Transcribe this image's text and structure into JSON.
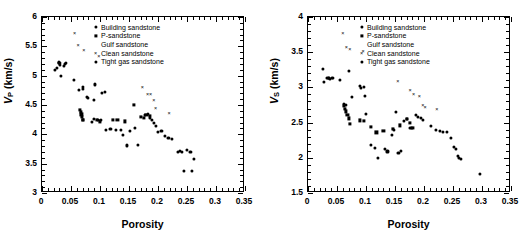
{
  "figure": {
    "panels": [
      "left",
      "right"
    ]
  },
  "legend": {
    "entries": [
      {
        "label": "Building sandstone",
        "marker": "circle-icon"
      },
      {
        "label": "P-sandstone",
        "marker": "square-icon"
      },
      {
        "label": "Gulf sandstone",
        "marker": "triangle-icon"
      },
      {
        "label": "Clean sandstone",
        "marker": "cross-icon"
      },
      {
        "label": "Tight gas sandstone",
        "marker": "diamond-icon"
      }
    ]
  },
  "chart_data": [
    {
      "id": "vp-vs-porosity",
      "type": "scatter",
      "title": "",
      "xlabel": "Porosity",
      "ylabel": "VP (km/s)",
      "ylabel_symbol": "V",
      "ylabel_subscript": "P",
      "ylabel_units": "(km/s)",
      "xlim": [
        0,
        0.35
      ],
      "ylim": [
        3,
        6
      ],
      "xticks": [
        0,
        0.05,
        0.1,
        0.15,
        0.2,
        0.25,
        0.3,
        0.35
      ],
      "xticklabels": [
        "0",
        "0.05",
        "0.1",
        "0.15",
        "0.2",
        "0.25",
        "0.3",
        "0.35"
      ],
      "yticks": [
        3,
        3.5,
        4,
        4.5,
        5,
        5.5,
        6
      ],
      "yticklabels": [
        "3",
        "3.5",
        "4",
        "4.5",
        "5",
        "5.5",
        "6"
      ],
      "xminor_per_major": 5,
      "yminor_per_major": 5,
      "grid": false,
      "legend_position": "top-right",
      "series": [
        {
          "name": "Building sandstone",
          "marker": "circle",
          "points": [
            [
              0.022,
              5.1
            ],
            [
              0.026,
              5.13
            ],
            [
              0.029,
              5.21
            ],
            [
              0.03,
              5.22
            ],
            [
              0.031,
              5.19
            ],
            [
              0.033,
              5.0
            ],
            [
              0.038,
              5.17
            ],
            [
              0.04,
              5.2
            ],
            [
              0.042,
              5.21
            ],
            [
              0.055,
              4.93
            ],
            [
              0.063,
              4.76
            ],
            [
              0.07,
              4.8
            ],
            [
              0.071,
              4.78
            ],
            [
              0.078,
              4.64
            ],
            [
              0.08,
              4.62
            ],
            [
              0.09,
              4.58
            ],
            [
              0.092,
              4.85
            ],
            [
              0.104,
              4.71
            ],
            [
              0.108,
              4.72
            ],
            [
              0.086,
              4.21
            ],
            [
              0.09,
              4.26
            ],
            [
              0.096,
              4.25
            ],
            [
              0.102,
              4.24
            ],
            [
              0.11,
              4.08
            ],
            [
              0.118,
              4.09
            ],
            [
              0.128,
              4.07
            ],
            [
              0.136,
              4.07
            ],
            [
              0.14,
              3.99
            ],
            [
              0.146,
              3.81
            ],
            [
              0.152,
              4.06
            ],
            [
              0.16,
              4.11
            ],
            [
              0.166,
              3.82
            ],
            [
              0.178,
              4.33
            ],
            [
              0.182,
              4.35
            ],
            [
              0.186,
              4.28
            ],
            [
              0.19,
              4.24
            ],
            [
              0.193,
              4.19
            ],
            [
              0.196,
              4.14
            ],
            [
              0.2,
              4.04
            ],
            [
              0.206,
              4.05
            ],
            [
              0.212,
              3.98
            ],
            [
              0.218,
              3.94
            ],
            [
              0.224,
              3.92
            ],
            [
              0.235,
              3.7
            ],
            [
              0.238,
              3.71
            ],
            [
              0.242,
              3.7
            ],
            [
              0.244,
              3.37
            ],
            [
              0.25,
              3.74
            ],
            [
              0.256,
              3.7
            ],
            [
              0.258,
              3.38
            ],
            [
              0.262,
              3.58
            ]
          ]
        },
        {
          "name": "P-sandstone",
          "marker": "square",
          "points": [
            [
              0.066,
              4.41
            ],
            [
              0.067,
              4.38
            ],
            [
              0.068,
              4.34
            ],
            [
              0.069,
              4.3
            ],
            [
              0.07,
              4.24
            ],
            [
              0.071,
              4.25
            ],
            [
              0.095,
              4.24
            ],
            [
              0.1,
              4.22
            ],
            [
              0.122,
              4.25
            ],
            [
              0.13,
              4.24
            ],
            [
              0.143,
              4.22
            ],
            [
              0.158,
              4.5
            ],
            [
              0.17,
              4.3
            ],
            [
              0.175,
              4.28
            ],
            [
              0.18,
              4.33
            ],
            [
              0.186,
              4.31
            ]
          ]
        },
        {
          "name": "Gulf sandstone",
          "marker": "triangle",
          "points": [
            [
              0.062,
              4.59
            ],
            [
              0.081,
              4.63
            ],
            [
              0.095,
              4.42
            ],
            [
              0.1,
              4.19
            ],
            [
              0.103,
              4.17
            ],
            [
              0.117,
              3.68
            ],
            [
              0.12,
              3.66
            ],
            [
              0.131,
              3.68
            ],
            [
              0.134,
              3.67
            ],
            [
              0.14,
              4.0
            ],
            [
              0.143,
              3.98
            ],
            [
              0.148,
              3.76
            ],
            [
              0.158,
              3.74
            ],
            [
              0.166,
              4.55
            ],
            [
              0.169,
              4.58
            ],
            [
              0.172,
              4.6
            ],
            [
              0.175,
              4.56
            ],
            [
              0.207,
              3.88
            ],
            [
              0.222,
              4.34
            ],
            [
              0.248,
              3.68
            ],
            [
              0.254,
              3.56
            ],
            [
              0.258,
              3.57
            ],
            [
              0.262,
              3.55
            ],
            [
              0.266,
              3.63
            ],
            [
              0.27,
              3.6
            ],
            [
              0.276,
              3.58
            ],
            [
              0.293,
              3.18
            ],
            [
              0.298,
              3.21
            ]
          ]
        },
        {
          "name": "Clean sandstone",
          "marker": "cross",
          "points": [
            [
              0.056,
              5.72
            ],
            [
              0.062,
              5.53
            ],
            [
              0.072,
              5.43
            ],
            [
              0.098,
              5.34
            ],
            [
              0.173,
              4.8
            ],
            [
              0.182,
              4.69
            ],
            [
              0.187,
              4.69
            ],
            [
              0.193,
              4.58
            ],
            [
              0.196,
              4.45
            ],
            [
              0.219,
              4.37
            ]
          ]
        },
        {
          "name": "Tight gas sandstone",
          "marker": "diamond",
          "points": [
            [
              0.03,
              5.23
            ],
            [
              0.031,
              5.22
            ]
          ]
        }
      ]
    },
    {
      "id": "vs-vs-porosity",
      "type": "scatter",
      "title": "",
      "xlabel": "Porosity",
      "ylabel": "VS (km/s)",
      "ylabel_symbol": "V",
      "ylabel_subscript": "S",
      "ylabel_units": "(km/s)",
      "xlim": [
        0,
        0.35
      ],
      "ylim": [
        1.5,
        4
      ],
      "xticks": [
        0,
        0.05,
        0.1,
        0.15,
        0.2,
        0.25,
        0.3,
        0.35
      ],
      "xticklabels": [
        "0",
        "0.05",
        "0.1",
        "0.15",
        "0.2",
        "0.25",
        "0.3",
        "0.35"
      ],
      "yticks": [
        1.5,
        2,
        2.5,
        3,
        3.5,
        4
      ],
      "yticklabels": [
        "1.5",
        "2",
        "2.5",
        "3",
        "3.5",
        "4"
      ],
      "xminor_per_major": 5,
      "yminor_per_major": 5,
      "grid": false,
      "legend_position": "top-right",
      "series": [
        {
          "name": "Building sandstone",
          "marker": "circle",
          "points": [
            [
              0.026,
              3.26
            ],
            [
              0.028,
              3.08
            ],
            [
              0.033,
              3.13
            ],
            [
              0.036,
              3.14
            ],
            [
              0.038,
              3.12
            ],
            [
              0.041,
              3.14
            ],
            [
              0.043,
              3.14
            ],
            [
              0.055,
              3.11
            ],
            [
              0.062,
              2.77
            ],
            [
              0.066,
              2.75
            ],
            [
              0.07,
              3.23
            ],
            [
              0.076,
              2.87
            ],
            [
              0.09,
              3.02
            ],
            [
              0.092,
              2.99
            ],
            [
              0.096,
              3.0
            ],
            [
              0.098,
              2.88
            ],
            [
              0.1,
              2.62
            ],
            [
              0.108,
              2.18
            ],
            [
              0.115,
              2.14
            ],
            [
              0.12,
              2.0
            ],
            [
              0.133,
              2.12
            ],
            [
              0.137,
              2.09
            ],
            [
              0.145,
              2.33
            ],
            [
              0.148,
              2.39
            ],
            [
              0.152,
              2.65
            ],
            [
              0.156,
              2.07
            ],
            [
              0.16,
              2.1
            ],
            [
              0.166,
              2.52
            ],
            [
              0.17,
              2.55
            ],
            [
              0.176,
              2.42
            ],
            [
              0.18,
              2.43
            ],
            [
              0.186,
              2.61
            ],
            [
              0.19,
              2.58
            ],
            [
              0.194,
              2.57
            ],
            [
              0.198,
              2.54
            ],
            [
              0.212,
              2.45
            ],
            [
              0.22,
              2.39
            ],
            [
              0.228,
              2.38
            ],
            [
              0.232,
              2.37
            ],
            [
              0.24,
              2.37
            ],
            [
              0.246,
              2.28
            ],
            [
              0.252,
              2.15
            ],
            [
              0.255,
              2.13
            ],
            [
              0.258,
              2.02
            ],
            [
              0.26,
              2.0
            ],
            [
              0.263,
              1.99
            ],
            [
              0.296,
              1.77
            ]
          ]
        },
        {
          "name": "P-sandstone",
          "marker": "square",
          "points": [
            [
              0.062,
              2.74
            ],
            [
              0.064,
              2.7
            ],
            [
              0.066,
              2.66
            ],
            [
              0.068,
              2.61
            ],
            [
              0.07,
              2.56
            ],
            [
              0.072,
              2.48
            ],
            [
              0.09,
              2.53
            ],
            [
              0.096,
              2.52
            ],
            [
              0.108,
              2.44
            ],
            [
              0.118,
              2.36
            ],
            [
              0.13,
              2.38
            ],
            [
              0.146,
              2.41
            ],
            [
              0.158,
              2.46
            ],
            [
              0.17,
              2.55
            ],
            [
              0.175,
              2.5
            ],
            [
              0.18,
              2.42
            ]
          ]
        },
        {
          "name": "Gulf sandstone",
          "marker": "triangle",
          "points": [
            [
              0.098,
              2.6
            ],
            [
              0.104,
              2.44
            ],
            [
              0.113,
              1.97
            ],
            [
              0.118,
              1.95
            ],
            [
              0.13,
              1.98
            ],
            [
              0.133,
              2.0
            ],
            [
              0.142,
              2.2
            ],
            [
              0.146,
              2.18
            ],
            [
              0.15,
              2.05
            ],
            [
              0.155,
              2.03
            ],
            [
              0.163,
              2.43
            ],
            [
              0.168,
              2.8
            ],
            [
              0.172,
              2.72
            ],
            [
              0.203,
              2.22
            ],
            [
              0.233,
              2.13
            ],
            [
              0.238,
              1.87
            ],
            [
              0.252,
              1.95
            ],
            [
              0.258,
              2.0
            ],
            [
              0.262,
              1.99
            ],
            [
              0.266,
              2.1
            ],
            [
              0.27,
              2.07
            ],
            [
              0.275,
              2.09
            ],
            [
              0.278,
              2.05
            ],
            [
              0.297,
              1.76
            ]
          ]
        },
        {
          "name": "Clean sandstone",
          "marker": "cross",
          "points": [
            [
              0.06,
              3.77
            ],
            [
              0.066,
              3.58
            ],
            [
              0.072,
              3.54
            ],
            [
              0.095,
              3.51
            ],
            [
              0.155,
              3.09
            ],
            [
              0.176,
              2.96
            ],
            [
              0.182,
              2.9
            ],
            [
              0.192,
              2.88
            ],
            [
              0.198,
              2.75
            ],
            [
              0.202,
              2.72
            ],
            [
              0.222,
              2.69
            ]
          ]
        },
        {
          "name": "Tight gas sandstone",
          "marker": "diamond",
          "points": [
            [
              0.034,
              3.13
            ],
            [
              0.036,
              3.14
            ]
          ]
        }
      ]
    }
  ]
}
